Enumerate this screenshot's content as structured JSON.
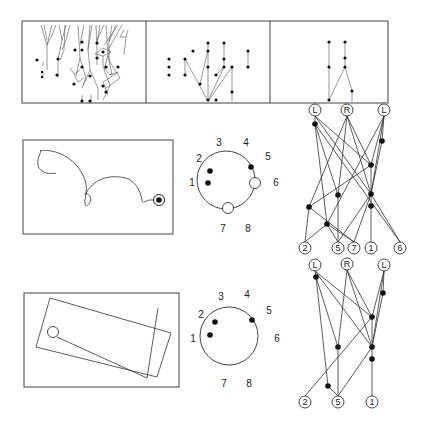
{
  "figure": {
    "top_panels": [
      {
        "name": "dense-tree-panel",
        "description": "many branching traces"
      },
      {
        "name": "medium-tree-panel",
        "description": "sparse dot network"
      },
      {
        "name": "sparse-tree-panel",
        "description": "two vertical chains"
      }
    ],
    "clock_top": {
      "labels": [
        "1",
        "2",
        "3",
        "4",
        "5",
        "6",
        "7",
        "8"
      ],
      "filled_positions": [
        "1",
        "2",
        "5"
      ],
      "open_positions": [
        "6",
        "7"
      ]
    },
    "clock_bottom": {
      "labels": [
        "1",
        "2",
        "3",
        "4",
        "5",
        "6",
        "7",
        "8"
      ],
      "filled_positions": [
        "1",
        "2",
        "5"
      ],
      "open_positions": []
    },
    "tree_top": {
      "roots": [
        "L",
        "R",
        "L"
      ],
      "leaves": [
        "2",
        "5",
        "7",
        "1",
        "6"
      ]
    },
    "tree_bottom": {
      "roots": [
        "L",
        "R",
        "L"
      ],
      "leaves": [
        "2",
        "5",
        "1"
      ]
    }
  }
}
